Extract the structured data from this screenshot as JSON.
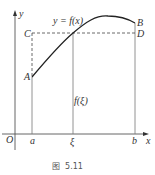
{
  "figure": {
    "caption": "图  5.11",
    "curve_label": "y = f(x)",
    "value_label": "f(ξ)",
    "axes": {
      "x_label": "x",
      "y_label": "y",
      "origin_label": "O"
    },
    "x_ticks": [
      "a",
      "ξ",
      "b"
    ],
    "points": {
      "A": "A",
      "B": "B",
      "C": "C",
      "D": "D"
    },
    "colors": {
      "line": "#333333",
      "dashed": "#444444",
      "vertical": "#777777",
      "background": "#ffffff"
    }
  }
}
